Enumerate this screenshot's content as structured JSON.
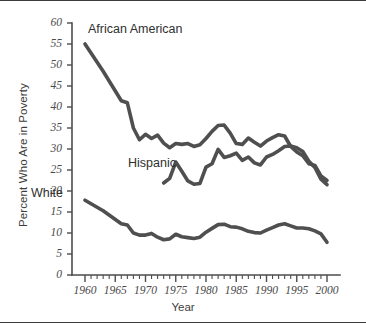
{
  "figure": {
    "frame_color": "#3a3a3a",
    "background": "#ffffff"
  },
  "axis_titles": {
    "y": "Percent Who Are in Poverty",
    "x": "Year"
  },
  "series_labels": {
    "african_american": "African American",
    "hispanic": "Hispanic",
    "white": "White"
  },
  "chart_data": {
    "type": "line",
    "title": "",
    "xlabel": "Year",
    "ylabel": "Percent Who Are in Poverty",
    "xlim": [
      1959,
      2001
    ],
    "ylim": [
      0,
      60
    ],
    "grid": false,
    "legend_position": "inline-annotations",
    "line_color": "#4f4f4f",
    "x_major_ticks": [
      1960,
      1965,
      1970,
      1975,
      1980,
      1985,
      1990,
      1995,
      2000
    ],
    "x_major_tick_labels": [
      "1960",
      "1965",
      "1970",
      "1975",
      "1980",
      "1985",
      "1990",
      "1995",
      "2000"
    ],
    "x_minor_tick_interval": 1,
    "y_ticks": [
      0,
      5,
      10,
      15,
      20,
      25,
      30,
      35,
      40,
      45,
      50,
      55,
      60
    ],
    "y_tick_labels": [
      "0",
      "5",
      "10",
      "15",
      "20",
      "25",
      "30",
      "35",
      "40",
      "45",
      "50",
      "55",
      "60"
    ],
    "series": [
      {
        "name": "African American",
        "x": [
          1960,
          1963,
          1966,
          1967,
          1968,
          1969,
          1970,
          1971,
          1972,
          1973,
          1974,
          1975,
          1976,
          1977,
          1978,
          1979,
          1980,
          1981,
          1982,
          1983,
          1984,
          1985,
          1986,
          1987,
          1988,
          1989,
          1990,
          1991,
          1992,
          1993,
          1994,
          1995,
          1996,
          1997,
          1998,
          1999,
          2000
        ],
        "values": [
          55.0,
          48.5,
          41.5,
          41.0,
          35.0,
          32.2,
          33.5,
          32.5,
          33.3,
          31.4,
          30.3,
          31.3,
          31.1,
          31.3,
          30.6,
          31.0,
          32.5,
          34.2,
          35.6,
          35.7,
          33.8,
          31.3,
          31.1,
          32.6,
          31.6,
          30.7,
          31.9,
          32.7,
          33.4,
          33.1,
          30.6,
          29.3,
          28.4,
          26.5,
          26.1,
          23.6,
          22.5
        ]
      },
      {
        "name": "Hispanic",
        "x": [
          1973,
          1974,
          1975,
          1976,
          1977,
          1978,
          1979,
          1980,
          1981,
          1982,
          1983,
          1984,
          1985,
          1986,
          1987,
          1988,
          1989,
          1990,
          1991,
          1992,
          1993,
          1994,
          1995,
          1996,
          1997,
          1998,
          1999,
          2000
        ],
        "values": [
          21.9,
          23.0,
          26.9,
          24.7,
          22.4,
          21.6,
          21.8,
          25.7,
          26.5,
          29.9,
          28.0,
          28.4,
          29.0,
          27.3,
          28.1,
          26.7,
          26.2,
          28.1,
          28.7,
          29.6,
          30.6,
          30.7,
          30.3,
          29.4,
          27.1,
          25.6,
          22.8,
          21.5
        ]
      },
      {
        "name": "White",
        "x": [
          1960,
          1963,
          1966,
          1967,
          1968,
          1969,
          1970,
          1971,
          1972,
          1973,
          1974,
          1975,
          1976,
          1977,
          1978,
          1979,
          1980,
          1981,
          1982,
          1983,
          1984,
          1985,
          1986,
          1987,
          1988,
          1989,
          1990,
          1991,
          1992,
          1993,
          1994,
          1995,
          1996,
          1997,
          1998,
          1999,
          2000
        ],
        "values": [
          17.8,
          15.3,
          12.2,
          11.9,
          10.0,
          9.5,
          9.5,
          9.9,
          9.0,
          8.4,
          8.6,
          9.7,
          9.1,
          8.9,
          8.7,
          9.0,
          10.2,
          11.1,
          12.0,
          12.1,
          11.5,
          11.4,
          11.0,
          10.4,
          10.1,
          10.0,
          10.7,
          11.3,
          11.9,
          12.2,
          11.7,
          11.2,
          11.2,
          11.0,
          10.5,
          9.8,
          7.8
        ]
      }
    ]
  }
}
